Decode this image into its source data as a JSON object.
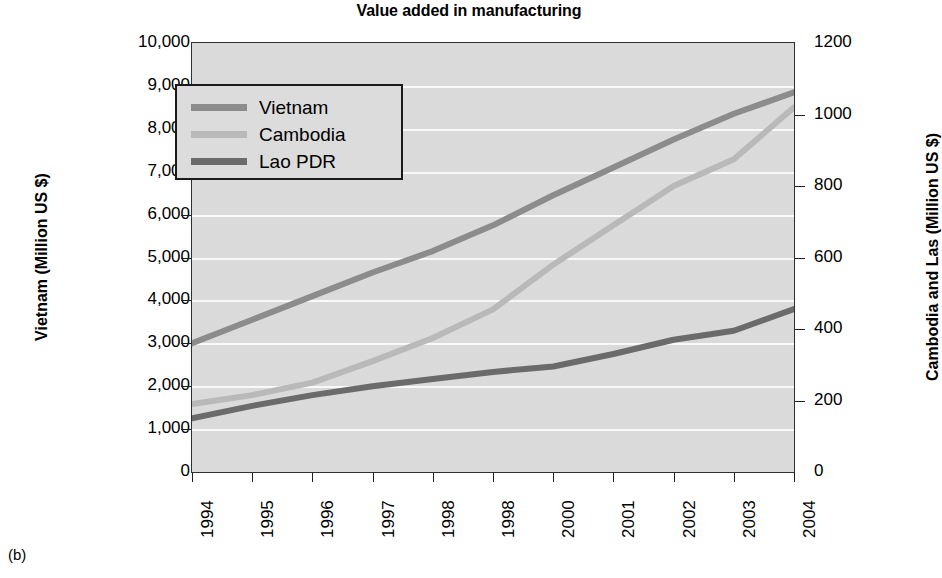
{
  "figure": {
    "title": "Value added in manufacturing",
    "caption": "(b)"
  },
  "axes": {
    "left_title": "Vietnam (Million US $)",
    "right_title": "Cambodia and Las (Million US $)",
    "left_ticks": [
      "10,000",
      "9,000",
      "8,000",
      "7,000",
      "6,000",
      "5,000",
      "4,000",
      "3,000",
      "2,000",
      "1,000",
      "0"
    ],
    "right_ticks": [
      "1200",
      "1000",
      "800",
      "600",
      "400",
      "200",
      "0"
    ],
    "x_ticks": [
      "1994",
      "1995",
      "1996",
      "1997",
      "1998",
      "1998",
      "2000",
      "2001",
      "2002",
      "2003",
      "2004"
    ]
  },
  "legend": {
    "items": [
      {
        "label": "Vietnam",
        "color": "#8c8c8c"
      },
      {
        "label": "Cambodia",
        "color": "#b9b9b9"
      },
      {
        "label": "Lao PDR",
        "color": "#6b6b6b"
      }
    ]
  },
  "colors": {
    "plot_background": "#dcdcdc",
    "gridline": "#fbfbfb",
    "frame": "#303030",
    "vietnam": "#8c8c8c",
    "cambodia": "#b9b9b9",
    "lao_pdr": "#6b6b6b"
  },
  "chart_data": {
    "type": "line",
    "title": "Value added in manufacturing",
    "xlabel": "",
    "ylabel": "Vietnam (Million US $)",
    "y2label": "Cambodia and Las (Million US $)",
    "ylim": [
      0,
      10000
    ],
    "y2lim": [
      0,
      1200
    ],
    "grid": true,
    "legend_position": "upper left",
    "x": [
      "1994",
      "1995",
      "1996",
      "1997",
      "1998",
      "1998",
      "2000",
      "2001",
      "2002",
      "2003",
      "2004"
    ],
    "series": [
      {
        "name": "Vietnam",
        "axis": "left",
        "units": "Million US $",
        "color": "#8c8c8c",
        "values": [
          3000,
          3550,
          4100,
          4650,
          5150,
          5750,
          6450,
          7100,
          7750,
          8350,
          8850
        ]
      },
      {
        "name": "Cambodia",
        "axis": "right",
        "units": "Million US $",
        "color": "#b9b9b9",
        "values": [
          190,
          215,
          250,
          310,
          375,
          455,
          580,
          690,
          800,
          875,
          1020
        ]
      },
      {
        "name": "Lao PDR",
        "axis": "right",
        "units": "Million US $",
        "color": "#6b6b6b",
        "values": [
          150,
          185,
          215,
          240,
          260,
          280,
          295,
          330,
          370,
          395,
          456
        ]
      }
    ]
  }
}
